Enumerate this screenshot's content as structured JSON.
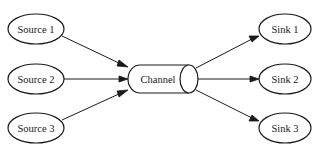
{
  "diagram": {
    "sources": [
      {
        "id": "source1",
        "label": "Source 1"
      },
      {
        "id": "source2",
        "label": "Source 2"
      },
      {
        "id": "source3",
        "label": "Source 3"
      }
    ],
    "channel": {
      "id": "channel",
      "label": "Channel"
    },
    "sinks": [
      {
        "id": "sink1",
        "label": "Sink 1"
      },
      {
        "id": "sink2",
        "label": "Sink 2"
      },
      {
        "id": "sink3",
        "label": "Sink 3"
      }
    ],
    "edges": [
      {
        "from": "source1",
        "to": "channel"
      },
      {
        "from": "source2",
        "to": "channel"
      },
      {
        "from": "source3",
        "to": "channel"
      },
      {
        "from": "channel",
        "to": "sink1"
      },
      {
        "from": "channel",
        "to": "sink2"
      },
      {
        "from": "channel",
        "to": "sink3"
      }
    ]
  }
}
